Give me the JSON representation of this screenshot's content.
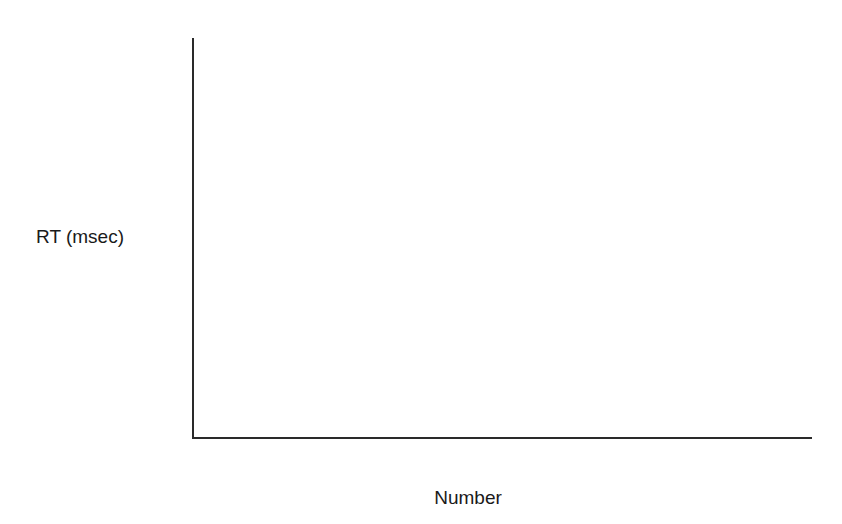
{
  "chart_data": {
    "type": "line",
    "title": "",
    "xlabel": "Number",
    "ylabel": "RT (msec)",
    "xlim": [
      0,
      9
    ],
    "ylim": [
      600,
      1600
    ],
    "x": [
      1,
      2,
      3,
      4,
      5,
      6,
      7,
      8
    ],
    "xticks": [
      0,
      2,
      4,
      6,
      8
    ],
    "xtick_labels": [
      "0",
      "2",
      "4",
      "6",
      "8"
    ],
    "yticks": [
      600,
      800,
      1000,
      1200,
      1400,
      1600
    ],
    "ytick_labels": [
      "600",
      "800",
      "1000",
      "1200",
      "1400",
      "1600"
    ],
    "y_minor_step": 50,
    "grid": false,
    "legend": "none",
    "series": [
      {
        "name": "Dots open circle",
        "marker": "open-circle",
        "values": [
          670,
          755,
          845,
          1025,
          1340,
          1435,
          1590,
          1500
        ]
      },
      {
        "name": "Dots filled circle",
        "marker": "filled-circle",
        "values": [
          670,
          735,
          780,
          955,
          1290,
          1390,
          1550,
          1480
        ]
      },
      {
        "name": "Bargraphs open square",
        "marker": "open-square",
        "values": [
          740,
          845,
          875,
          685,
          750,
          865,
          910,
          700
        ]
      },
      {
        "name": "Bargraphs filled square",
        "marker": "filled-square",
        "values": [
          710,
          815,
          775,
          680,
          720,
          845,
          855,
          680
        ]
      }
    ],
    "annotations": [
      {
        "text": "Dots",
        "x": 7.05,
        "y": 1395
      },
      {
        "text": "Bargraphs",
        "x": 6.1,
        "y": 1010
      }
    ]
  },
  "colors": {
    "axis": "#2a2a2a",
    "line": "#1a1a1a",
    "marker_fill": "#111111",
    "marker_open": "#ffffff",
    "background": "#ffffff"
  }
}
